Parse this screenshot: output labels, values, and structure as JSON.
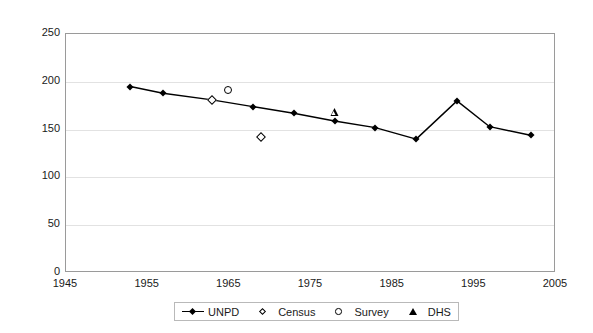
{
  "chart_data": {
    "type": "line",
    "title": "",
    "subtitle": "",
    "xlabel": "",
    "ylabel": "",
    "xlim": [
      1945,
      2005
    ],
    "ylim": [
      0,
      250
    ],
    "x_ticks": [
      1945,
      1955,
      1965,
      1975,
      1985,
      1995,
      2005
    ],
    "y_ticks": [
      0,
      50,
      100,
      150,
      200,
      250
    ],
    "grid": "horizontal",
    "legend_position": "bottom-center",
    "series": [
      {
        "name": "UNPD",
        "marker": "filled-diamond",
        "line": true,
        "color": "#000000",
        "points": [
          {
            "x": 1953,
            "y": 194
          },
          {
            "x": 1957,
            "y": 187
          },
          {
            "x": 1963,
            "y": 180
          },
          {
            "x": 1968,
            "y": 173
          },
          {
            "x": 1973,
            "y": 166
          },
          {
            "x": 1978,
            "y": 158
          },
          {
            "x": 1983,
            "y": 151
          },
          {
            "x": 1988,
            "y": 139
          },
          {
            "x": 1993,
            "y": 179
          },
          {
            "x": 1997,
            "y": 152
          },
          {
            "x": 2002,
            "y": 143
          }
        ]
      },
      {
        "name": "Census",
        "marker": "open-diamond",
        "line": false,
        "color": "#000000",
        "points": [
          {
            "x": 1963,
            "y": 180
          },
          {
            "x": 1969,
            "y": 141
          }
        ]
      },
      {
        "name": "Survey",
        "marker": "open-circle",
        "line": false,
        "color": "#000000",
        "points": [
          {
            "x": 1965,
            "y": 190
          }
        ]
      },
      {
        "name": "DHS",
        "marker": "open-triangle",
        "line": false,
        "color": "#000000",
        "points": [
          {
            "x": 1978,
            "y": 166
          }
        ]
      }
    ]
  },
  "axes": {
    "y_tick_labels": [
      "250",
      "200",
      "150",
      "100",
      "50",
      "0"
    ],
    "x_tick_labels": [
      "1945",
      "1955",
      "1965",
      "1975",
      "1985",
      "1995",
      "2005"
    ]
  },
  "legend": {
    "entries": [
      {
        "label": "UNPD",
        "key": "line-with-filled-diamond"
      },
      {
        "label": "Census",
        "key": "open-diamond"
      },
      {
        "label": "Survey",
        "key": "open-circle"
      },
      {
        "label": "DHS",
        "key": "open-triangle"
      }
    ]
  },
  "colors": {
    "series": "#000000",
    "grid": "#e2e2e2",
    "frame": "#9a9a9a",
    "background": "#ffffff"
  }
}
